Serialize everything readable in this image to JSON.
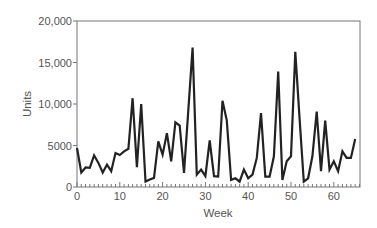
{
  "chart_data": {
    "type": "line",
    "title": "",
    "xlabel": "Week",
    "ylabel": "Units",
    "xlim": [
      0,
      66
    ],
    "ylim": [
      0,
      20000
    ],
    "x_ticks": [
      0,
      10,
      20,
      30,
      40,
      50,
      60
    ],
    "x_tick_labels": [
      "0",
      "10",
      "20",
      "30",
      "40",
      "50",
      "60"
    ],
    "y_ticks": [
      0,
      5000,
      10000,
      15000,
      20000
    ],
    "y_tick_labels": [
      "0",
      "5000",
      "10,000",
      "15,000",
      "20,000"
    ],
    "grid": false,
    "legend": null,
    "line_color": "#222222",
    "x": [
      0,
      1,
      2,
      3,
      4,
      5,
      6,
      7,
      8,
      9,
      10,
      11,
      12,
      13,
      14,
      15,
      16,
      17,
      18,
      19,
      20,
      21,
      22,
      23,
      24,
      25,
      26,
      27,
      28,
      29,
      30,
      31,
      32,
      33,
      34,
      35,
      36,
      37,
      38,
      39,
      40,
      41,
      42,
      43,
      44,
      45,
      46,
      47,
      48,
      49,
      50,
      51,
      52,
      53,
      54,
      55,
      56,
      57,
      58,
      59,
      60,
      61,
      62,
      63,
      64,
      65
    ],
    "series": [
      {
        "name": "Units",
        "values": [
          4700,
          1750,
          2350,
          2300,
          3800,
          2900,
          1750,
          2700,
          1900,
          4100,
          3850,
          4300,
          4600,
          10700,
          2400,
          10000,
          650,
          900,
          1100,
          5500,
          3900,
          6500,
          3100,
          7800,
          7400,
          1700,
          9200,
          16800,
          1500,
          2100,
          1300,
          5600,
          1300,
          1250,
          10400,
          8000,
          850,
          1050,
          650,
          2100,
          1050,
          1500,
          3500,
          8900,
          1250,
          1250,
          3700,
          13900,
          850,
          3100,
          3700,
          16300,
          8200,
          650,
          1050,
          3700,
          9100,
          1900,
          8000,
          2100,
          3100,
          1900,
          4300,
          3500,
          3500,
          5800
        ]
      }
    ]
  }
}
